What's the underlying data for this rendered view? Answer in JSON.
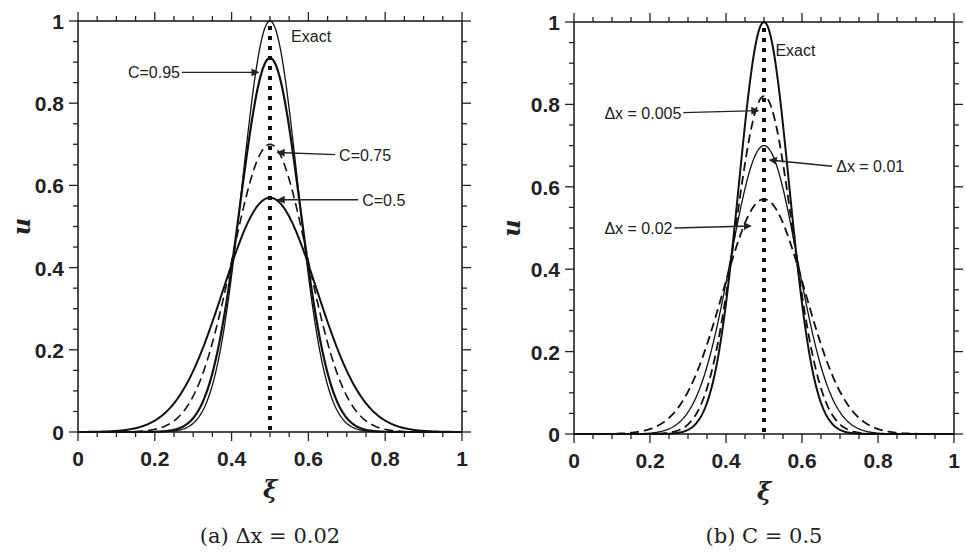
{
  "figure": {
    "panels": [
      {
        "id": "a",
        "caption": "(a) Δx = 0.02",
        "xlabel": "ξ",
        "ylabel": "u"
      },
      {
        "id": "b",
        "caption": "(b) C = 0.5",
        "xlabel": "ξ",
        "ylabel": "u"
      }
    ]
  },
  "chart_data": [
    {
      "type": "line",
      "title": "(a) Δx = 0.02",
      "xlabel": "ξ",
      "ylabel": "u",
      "xlim": [
        0,
        1
      ],
      "ylim": [
        0,
        1
      ],
      "xticks": [
        "0",
        "0.2",
        "0.4",
        "0.6",
        "0.8",
        "1"
      ],
      "yticks": [
        "0",
        "0.2",
        "0.4",
        "0.6",
        "0.8",
        "1"
      ],
      "minor_tick_step": 0.05,
      "grid": false,
      "reference_line": {
        "x": 0.5,
        "style": "dotted"
      },
      "series": [
        {
          "name": "Exact",
          "peak": 1.0,
          "center": 0.5,
          "sigma": 0.072,
          "style": "solid",
          "width": 1.3,
          "x": [
            0.2,
            0.3,
            0.35,
            0.4,
            0.45,
            0.5,
            0.55,
            0.6,
            0.65,
            0.7,
            0.8
          ],
          "values": [
            0.0,
            0.02,
            0.11,
            0.38,
            0.79,
            1.0,
            0.79,
            0.38,
            0.11,
            0.02,
            0.0
          ]
        },
        {
          "name": "C=0.95",
          "peak": 0.91,
          "center": 0.5,
          "sigma": 0.078,
          "style": "solid",
          "width": 2.2,
          "x": [
            0.2,
            0.3,
            0.35,
            0.4,
            0.45,
            0.5,
            0.55,
            0.6,
            0.65,
            0.7,
            0.8
          ],
          "values": [
            0.0,
            0.03,
            0.14,
            0.4,
            0.74,
            0.91,
            0.74,
            0.4,
            0.14,
            0.03,
            0.0
          ]
        },
        {
          "name": "C=0.75",
          "peak": 0.7,
          "center": 0.5,
          "sigma": 0.098,
          "style": "dashed",
          "width": 1.6,
          "x": [
            0.2,
            0.3,
            0.35,
            0.4,
            0.45,
            0.5,
            0.55,
            0.6,
            0.65,
            0.7,
            0.8
          ],
          "values": [
            0.01,
            0.09,
            0.22,
            0.42,
            0.61,
            0.7,
            0.61,
            0.42,
            0.22,
            0.09,
            0.01
          ]
        },
        {
          "name": "C=0.5",
          "peak": 0.57,
          "center": 0.5,
          "sigma": 0.122,
          "style": "solid",
          "width": 2.0,
          "x": [
            0.2,
            0.3,
            0.35,
            0.4,
            0.45,
            0.5,
            0.55,
            0.6,
            0.65,
            0.7,
            0.8
          ],
          "values": [
            0.03,
            0.15,
            0.27,
            0.41,
            0.52,
            0.57,
            0.52,
            0.41,
            0.27,
            0.15,
            0.03
          ]
        }
      ],
      "annotations": [
        {
          "text": "Exact",
          "x": 0.555,
          "y": 0.96,
          "arrow": false
        },
        {
          "text": "C=0.95",
          "text_x": 0.13,
          "text_y": 0.875,
          "arrow_to": [
            0.47,
            0.875
          ],
          "arrow": true
        },
        {
          "text": "C=0.75",
          "text_x": 0.68,
          "text_y": 0.675,
          "arrow_to": [
            0.52,
            0.68
          ],
          "arrow": true
        },
        {
          "text": "C=0.5",
          "text_x": 0.74,
          "text_y": 0.565,
          "arrow_to": [
            0.52,
            0.565
          ],
          "arrow": true
        }
      ]
    },
    {
      "type": "line",
      "title": "(b) C = 0.5",
      "xlabel": "ξ",
      "ylabel": "u",
      "xlim": [
        0,
        1
      ],
      "ylim": [
        0,
        1
      ],
      "xticks": [
        "0",
        "0.2",
        "0.4",
        "0.6",
        "0.8",
        "1"
      ],
      "yticks": [
        "0",
        "0.2",
        "0.4",
        "0.6",
        "0.8",
        "1"
      ],
      "minor_tick_step": 0.05,
      "grid": false,
      "reference_line": {
        "x": 0.5,
        "style": "dotted"
      },
      "series": [
        {
          "name": "Exact",
          "peak": 1.0,
          "center": 0.5,
          "sigma": 0.066,
          "style": "solid",
          "width": 2.0,
          "x": [
            0.2,
            0.3,
            0.35,
            0.4,
            0.45,
            0.5,
            0.55,
            0.6,
            0.65,
            0.7,
            0.8
          ],
          "values": [
            0.0,
            0.01,
            0.08,
            0.32,
            0.75,
            1.0,
            0.75,
            0.32,
            0.08,
            0.01,
            0.0
          ]
        },
        {
          "name": "Δx = 0.005",
          "peak": 0.82,
          "center": 0.5,
          "sigma": 0.075,
          "style": "dashed",
          "width": 1.8,
          "x": [
            0.2,
            0.3,
            0.35,
            0.4,
            0.45,
            0.5,
            0.55,
            0.6,
            0.65,
            0.7,
            0.8
          ],
          "values": [
            0.0,
            0.02,
            0.11,
            0.34,
            0.66,
            0.82,
            0.66,
            0.34,
            0.11,
            0.02,
            0.0
          ]
        },
        {
          "name": "Δx = 0.01",
          "peak": 0.7,
          "center": 0.5,
          "sigma": 0.088,
          "style": "solid",
          "width": 1.3,
          "x": [
            0.2,
            0.3,
            0.35,
            0.4,
            0.45,
            0.5,
            0.55,
            0.6,
            0.65,
            0.7,
            0.8
          ],
          "values": [
            0.0,
            0.05,
            0.16,
            0.37,
            0.6,
            0.7,
            0.6,
            0.37,
            0.16,
            0.05,
            0.0
          ]
        },
        {
          "name": "Δx = 0.02",
          "peak": 0.57,
          "center": 0.5,
          "sigma": 0.108,
          "style": "dashed",
          "width": 1.8,
          "x": [
            0.2,
            0.3,
            0.35,
            0.4,
            0.45,
            0.5,
            0.55,
            0.6,
            0.65,
            0.7,
            0.8
          ],
          "values": [
            0.01,
            0.1,
            0.21,
            0.37,
            0.51,
            0.57,
            0.51,
            0.37,
            0.21,
            0.1,
            0.01
          ]
        }
      ],
      "annotations": [
        {
          "text": "Exact",
          "x": 0.53,
          "y": 0.93,
          "arrow": false
        },
        {
          "text": "Δx = 0.005",
          "text_x": 0.08,
          "text_y": 0.78,
          "arrow_to": [
            0.485,
            0.785
          ],
          "arrow": true
        },
        {
          "text": "Δx = 0.01",
          "text_x": 0.69,
          "text_y": 0.65,
          "arrow_to": [
            0.515,
            0.665
          ],
          "arrow": true
        },
        {
          "text": "Δx = 0.02",
          "text_x": 0.08,
          "text_y": 0.5,
          "arrow_to": [
            0.465,
            0.505
          ],
          "arrow": true
        }
      ]
    }
  ]
}
